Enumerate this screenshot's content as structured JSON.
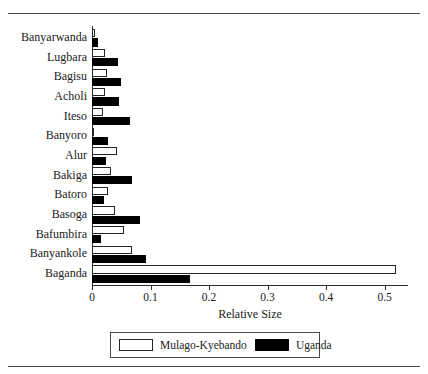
{
  "figure": {
    "xlabel": "Relative Size"
  },
  "legend": {
    "items": [
      {
        "label": "Mulago-Kyebando",
        "style": "light",
        "color": "#ffffff"
      },
      {
        "label": "Uganda",
        "style": "dark",
        "color": "#000000"
      }
    ]
  },
  "chart_data": {
    "type": "bar",
    "orientation": "horizontal",
    "title": "",
    "xlabel": "Relative Size",
    "ylabel": "",
    "xlim": [
      0,
      0.54
    ],
    "xticks": [
      0,
      0.1,
      0.2,
      0.3,
      0.4,
      0.5
    ],
    "xticklabels": [
      "0",
      "0.1",
      "0.2",
      "0.3",
      "0.4",
      "0.5"
    ],
    "grid": false,
    "legend_position": "below-axis",
    "categories": [
      "Banyarwanda",
      "Lugbara",
      "Bagisu",
      "Acholi",
      "Iteso",
      "Banyoro",
      "Alur",
      "Bakiga",
      "Batoro",
      "Basoga",
      "Bafumbira",
      "Banyankole",
      "Baganda"
    ],
    "series": [
      {
        "name": "Mulago-Kyebando",
        "color": "#ffffff",
        "values": [
          0.005,
          0.023,
          0.026,
          0.022,
          0.019,
          0.004,
          0.043,
          0.032,
          0.028,
          0.04,
          0.054,
          0.069,
          0.52
        ]
      },
      {
        "name": "Uganda",
        "color": "#000000",
        "values": [
          0.01,
          0.045,
          0.049,
          0.046,
          0.065,
          0.028,
          0.024,
          0.068,
          0.021,
          0.082,
          0.015,
          0.093,
          0.167
        ]
      }
    ]
  }
}
